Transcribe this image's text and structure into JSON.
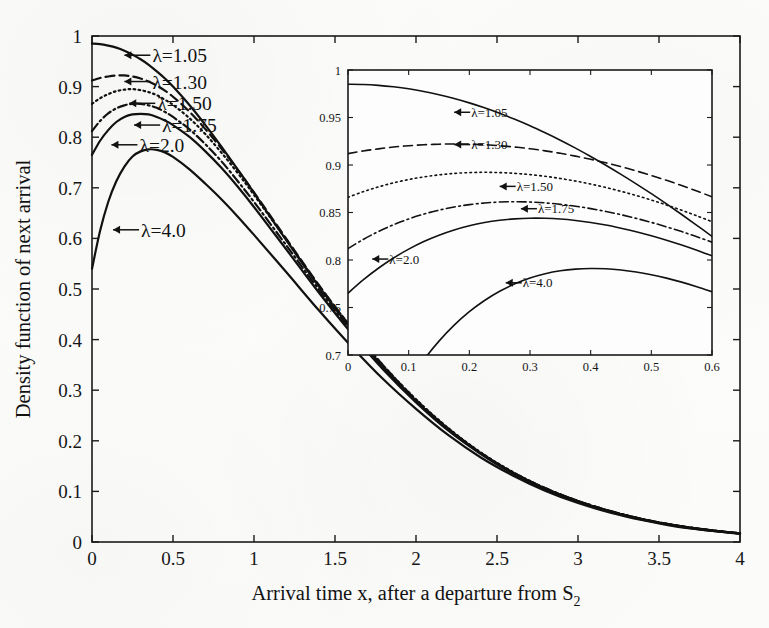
{
  "figure": {
    "background_color": "#fdfdfc",
    "ink_color": "#111111"
  },
  "chart_data": {
    "type": "line",
    "title": "",
    "xlabel": "Arrival time x, after a departure from S2",
    "xlabel_main": "Arrival time x, after a departure from S",
    "xlabel_sub": "2",
    "ylabel": "Density function of next arrival",
    "xlim": [
      0,
      4
    ],
    "ylim": [
      0,
      1
    ],
    "grid": false,
    "legend_position": "inline-arrow-annotations",
    "xticks": [
      0,
      0.5,
      1,
      1.5,
      2,
      2.5,
      3,
      3.5,
      4
    ],
    "xtick_labels": [
      "0",
      "0.5",
      "1",
      "1.5",
      "2",
      "2.5",
      "3",
      "3.5",
      "4"
    ],
    "yticks": [
      0,
      0.1,
      0.2,
      0.3,
      0.4,
      0.5,
      0.6,
      0.7,
      0.8,
      0.9,
      1
    ],
    "ytick_labels": [
      "0",
      "0.1",
      "0.2",
      "0.3",
      "0.4",
      "0.5",
      "0.6",
      "0.7",
      "0.8",
      "0.9",
      "1"
    ],
    "x": [
      0,
      0.05,
      0.1,
      0.15,
      0.2,
      0.25,
      0.3,
      0.35,
      0.4,
      0.45,
      0.5,
      0.6,
      0.7,
      0.8,
      0.9,
      1.0,
      1.2,
      1.4,
      1.6,
      1.8,
      2.0,
      2.2,
      2.4,
      2.6,
      2.8,
      3.0,
      3.2,
      3.4,
      3.6,
      3.8,
      4.0
    ],
    "series": [
      {
        "name": "lambda=1.05",
        "label": "λ=1.05",
        "lambda": 1.05,
        "linestyle": "solid",
        "values": [
          0.985,
          0.984,
          0.981,
          0.977,
          0.971,
          0.963,
          0.954,
          0.943,
          0.93,
          0.916,
          0.9,
          0.864,
          0.824,
          0.781,
          0.736,
          0.69,
          0.596,
          0.505,
          0.421,
          0.345,
          0.279,
          0.222,
          0.175,
          0.136,
          0.105,
          0.08,
          0.06,
          0.045,
          0.033,
          0.024,
          0.017
        ]
      },
      {
        "name": "lambda=1.30",
        "label": "λ=1.30",
        "lambda": 1.3,
        "linestyle": "dashed",
        "values": [
          0.912,
          0.917,
          0.92,
          0.922,
          0.922,
          0.92,
          0.916,
          0.91,
          0.902,
          0.892,
          0.88,
          0.851,
          0.816,
          0.777,
          0.735,
          0.691,
          0.599,
          0.508,
          0.424,
          0.348,
          0.281,
          0.224,
          0.176,
          0.137,
          0.106,
          0.081,
          0.061,
          0.045,
          0.033,
          0.024,
          0.017
        ]
      },
      {
        "name": "lambda=1.50",
        "label": "λ=1.50",
        "lambda": 1.5,
        "linestyle": "dotted",
        "values": [
          0.866,
          0.877,
          0.885,
          0.891,
          0.894,
          0.895,
          0.893,
          0.889,
          0.883,
          0.874,
          0.864,
          0.838,
          0.806,
          0.769,
          0.729,
          0.686,
          0.597,
          0.507,
          0.424,
          0.348,
          0.282,
          0.225,
          0.177,
          0.138,
          0.106,
          0.081,
          0.061,
          0.045,
          0.033,
          0.024,
          0.017
        ]
      },
      {
        "name": "lambda=1.75",
        "label": "λ=1.75",
        "lambda": 1.75,
        "linestyle": "dashdot",
        "values": [
          0.812,
          0.832,
          0.847,
          0.857,
          0.863,
          0.866,
          0.866,
          0.863,
          0.858,
          0.85,
          0.84,
          0.816,
          0.786,
          0.752,
          0.713,
          0.672,
          0.586,
          0.499,
          0.418,
          0.344,
          0.279,
          0.223,
          0.176,
          0.137,
          0.106,
          0.081,
          0.061,
          0.045,
          0.033,
          0.024,
          0.017
        ]
      },
      {
        "name": "lambda=2.0",
        "label": "λ=2.0",
        "lambda": 2.0,
        "linestyle": "solid",
        "values": [
          0.765,
          0.793,
          0.814,
          0.83,
          0.84,
          0.845,
          0.846,
          0.845,
          0.84,
          0.833,
          0.824,
          0.801,
          0.772,
          0.739,
          0.702,
          0.662,
          0.578,
          0.493,
          0.413,
          0.34,
          0.276,
          0.22,
          0.174,
          0.135,
          0.104,
          0.08,
          0.06,
          0.044,
          0.032,
          0.023,
          0.017
        ]
      },
      {
        "name": "lambda=4.0",
        "label": "λ=4.0",
        "lambda": 4.0,
        "linestyle": "solid",
        "values": [
          0.54,
          0.615,
          0.672,
          0.713,
          0.742,
          0.762,
          0.772,
          0.776,
          0.775,
          0.77,
          0.761,
          0.737,
          0.708,
          0.677,
          0.643,
          0.607,
          0.533,
          0.458,
          0.387,
          0.321,
          0.263,
          0.211,
          0.167,
          0.131,
          0.101,
          0.077,
          0.058,
          0.043,
          0.031,
          0.023,
          0.016
        ]
      }
    ],
    "annotations": [
      {
        "text": "λ=1.05",
        "x": 0.2,
        "y": 0.962
      },
      {
        "text": "λ=1.30",
        "x": 0.2,
        "y": 0.91
      },
      {
        "text": "λ=1.50",
        "x": 0.23,
        "y": 0.867
      },
      {
        "text": "λ=1.75",
        "x": 0.26,
        "y": 0.824
      },
      {
        "text": "λ=2.0",
        "x": 0.12,
        "y": 0.785
      },
      {
        "text": "λ=4.0",
        "x": 0.13,
        "y": 0.617
      }
    ],
    "inset": {
      "type": "line",
      "title": "",
      "xlim": [
        0,
        0.6
      ],
      "ylim": [
        0.7,
        1
      ],
      "grid": false,
      "xticks": [
        0,
        0.1,
        0.2,
        0.3,
        0.4,
        0.5,
        0.6
      ],
      "xtick_labels": [
        "0",
        "0.1",
        "0.2",
        "0.3",
        "0.4",
        "0.5",
        "0.6"
      ],
      "yticks": [
        0.7,
        0.75,
        0.8,
        0.85,
        0.9,
        0.95,
        1
      ],
      "ytick_labels": [
        "0.7",
        "0.75",
        "0.8",
        "0.85",
        "0.9",
        "0.95",
        "1"
      ],
      "x": [
        0,
        0.025,
        0.05,
        0.075,
        0.1,
        0.125,
        0.15,
        0.175,
        0.2,
        0.225,
        0.25,
        0.275,
        0.3,
        0.325,
        0.35,
        0.375,
        0.4,
        0.425,
        0.45,
        0.475,
        0.5,
        0.525,
        0.55,
        0.575,
        0.6
      ],
      "series": [
        {
          "name": "lambda=1.05",
          "label": "λ=1.05",
          "lambda": 1.05,
          "linestyle": "solid",
          "values": [
            0.985,
            0.9847,
            0.9838,
            0.9823,
            0.9802,
            0.9774,
            0.974,
            0.97,
            0.9654,
            0.9602,
            0.9544,
            0.9481,
            0.9413,
            0.9339,
            0.9261,
            0.9178,
            0.909,
            0.8998,
            0.8902,
            0.8802,
            0.8698,
            0.859,
            0.8479,
            0.8365,
            0.8248
          ]
        },
        {
          "name": "lambda=1.30",
          "label": "λ=1.30",
          "lambda": 1.3,
          "linestyle": "dashed",
          "values": [
            0.912,
            0.9148,
            0.917,
            0.9189,
            0.9203,
            0.9213,
            0.9219,
            0.9221,
            0.9219,
            0.9213,
            0.9203,
            0.9189,
            0.9171,
            0.9149,
            0.9123,
            0.9093,
            0.906,
            0.9023,
            0.8982,
            0.8938,
            0.889,
            0.8839,
            0.8784,
            0.8726,
            0.8665
          ]
        },
        {
          "name": "lambda=1.50",
          "label": "λ=1.50",
          "lambda": 1.5,
          "linestyle": "dotted",
          "values": [
            0.866,
            0.8719,
            0.8769,
            0.8812,
            0.8847,
            0.8875,
            0.8896,
            0.8911,
            0.892,
            0.8923,
            0.892,
            0.8912,
            0.8899,
            0.8881,
            0.8858,
            0.8831,
            0.8799,
            0.8763,
            0.8723,
            0.8679,
            0.8631,
            0.8579,
            0.8524,
            0.8465,
            0.8403
          ]
        },
        {
          "name": "lambda=1.75",
          "label": "λ=1.75",
          "lambda": 1.75,
          "linestyle": "dashdot",
          "values": [
            0.812,
            0.8216,
            0.8299,
            0.8371,
            0.8432,
            0.8483,
            0.8525,
            0.8558,
            0.8583,
            0.86,
            0.861,
            0.8613,
            0.861,
            0.8601,
            0.8586,
            0.8566,
            0.8541,
            0.8511,
            0.8477,
            0.8438,
            0.8396,
            0.8349,
            0.8299,
            0.8245,
            0.8188
          ]
        },
        {
          "name": "lambda=2.0",
          "label": "λ=2.0",
          "lambda": 2.0,
          "linestyle": "solid",
          "values": [
            0.765,
            0.779,
            0.7913,
            0.8021,
            0.8114,
            0.8194,
            0.8261,
            0.8316,
            0.836,
            0.8394,
            0.8418,
            0.8433,
            0.844,
            0.8439,
            0.8431,
            0.8416,
            0.8395,
            0.8368,
            0.8335,
            0.8298,
            0.8256,
            0.8209,
            0.8158,
            0.8103,
            0.8044
          ]
        },
        {
          "name": "lambda=4.0",
          "label": "λ=4.0",
          "lambda": 4.0,
          "linestyle": "solid",
          "values": [
            0.54,
            0.58,
            0.615,
            0.6455,
            0.672,
            0.6949,
            0.7146,
            0.7314,
            0.7456,
            0.7574,
            0.7671,
            0.7749,
            0.781,
            0.7855,
            0.7886,
            0.7904,
            0.7911,
            0.7908,
            0.7895,
            0.7874,
            0.7845,
            0.7809,
            0.7767,
            0.7719,
            0.7666
          ]
        }
      ],
      "annotations": [
        {
          "text": "λ=1.05",
          "x": 0.175,
          "y": 0.9555
        },
        {
          "text": "λ=1.30",
          "x": 0.175,
          "y": 0.9215
        },
        {
          "text": "λ=1.50",
          "x": 0.25,
          "y": 0.8775
        },
        {
          "text": "λ=1.75",
          "x": 0.285,
          "y": 0.854
        },
        {
          "text": "λ=2.0",
          "x": 0.04,
          "y": 0.801
        },
        {
          "text": "λ=4.0",
          "x": 0.26,
          "y": 0.776
        }
      ]
    }
  }
}
